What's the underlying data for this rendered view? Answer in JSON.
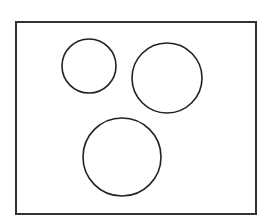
{
  "diagram": {
    "frame": {
      "x": 16,
      "y": 22,
      "width": 240,
      "height": 192,
      "stroke": "#333333"
    },
    "circles": [
      {
        "cx": 89,
        "cy": 66,
        "r": 27
      },
      {
        "cx": 167,
        "cy": 78,
        "r": 35
      },
      {
        "cx": 122,
        "cy": 157,
        "r": 39
      }
    ],
    "stroke_color": "#222222"
  }
}
